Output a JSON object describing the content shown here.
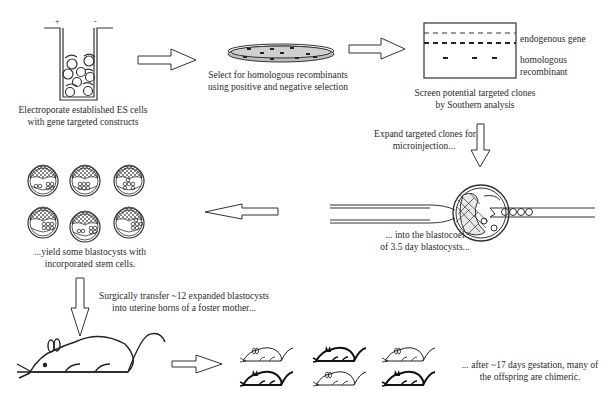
{
  "steps": {
    "electroporate": {
      "line1": "Electroporate established ES cells",
      "line2": "with gene targeted constructs",
      "electrode_plus": "+",
      "electrode_minus": "-"
    },
    "select": {
      "line1": "Select for homologous recombinants",
      "line2": "using positive and negative selection"
    },
    "southern": {
      "line1": "Screen potential targeted clones",
      "line2": "by Southern analysis",
      "band_label_1": "endogenous gene",
      "band_label_2a": "homologous",
      "band_label_2b": "recombinant"
    },
    "expand": {
      "line1": "Expand targeted clones for",
      "line2": "microinjection..."
    },
    "inject": {
      "line1": "... into the blastocoel",
      "line2": "of  3.5 day blastocysts..."
    },
    "yield": {
      "line1": "...yield some blastocysts with",
      "line2": "incorporated stem cells."
    },
    "transfer": {
      "line1": "Surgically transfer ~12 expanded blastocysts",
      "line2": "into uterine horns of a foster mother..."
    },
    "offspring": {
      "line1": "... after ~17 days gestation, many  of",
      "line2": "the offspring are chimeric."
    }
  },
  "icons": [
    "electroporation-cuvette-icon",
    "petri-dish-icon",
    "southern-blot-icon",
    "microinjection-icon",
    "blastocyst-grid-icon",
    "foster-mouse-icon",
    "chimeric-pups-icon",
    "arrow-right-icon",
    "arrow-down-icon",
    "arrow-left-icon"
  ]
}
